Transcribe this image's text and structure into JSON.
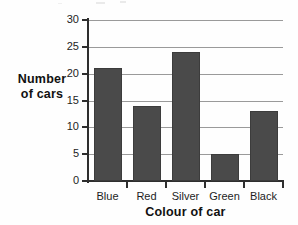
{
  "chart_data": {
    "type": "bar",
    "title": "",
    "xlabel": "Colour of car",
    "ylabel": "Number of cars",
    "ylabel_lines": [
      "Number",
      "of cars"
    ],
    "categories": [
      "Blue",
      "Red",
      "Silver",
      "Green",
      "Black"
    ],
    "values": [
      21,
      14,
      24,
      5,
      13
    ],
    "ylim": [
      0,
      30
    ],
    "ytick_labels": [
      "0",
      "5",
      "10",
      "15",
      "20",
      "25",
      "30"
    ],
    "ytick_values": [
      0,
      5,
      10,
      15,
      20,
      25,
      30
    ],
    "grid": "horizontal",
    "legend": "none",
    "bar_color": "#4a4a4a",
    "axis_color": "#2e2e2e",
    "gridline_color": "#9a9a9a",
    "background_color": "#fefefe"
  }
}
